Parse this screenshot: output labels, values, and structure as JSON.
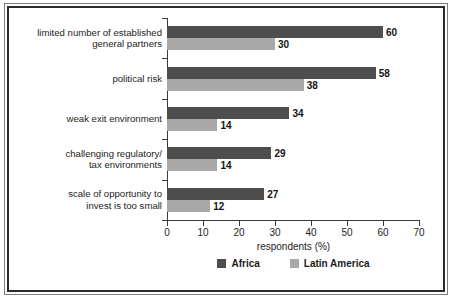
{
  "chart_data": {
    "type": "bar",
    "orientation": "horizontal",
    "title": "",
    "xlabel": "respondents (%)",
    "ylabel": "",
    "xlim": [
      0,
      70
    ],
    "xticks": [
      0,
      10,
      20,
      30,
      40,
      50,
      60,
      70
    ],
    "grid": false,
    "legend_position": "bottom",
    "categories": [
      "limited number of established\ngeneral partners",
      "political risk",
      "weak exit environment",
      "challenging regulatory/\ntax environments",
      "scale of opportunity to\ninvest is too small"
    ],
    "series": [
      {
        "name": "Africa",
        "color": "#4d4d4d",
        "values": [
          60,
          58,
          34,
          29,
          27
        ]
      },
      {
        "name": "Latin America",
        "color": "#a8a8a8",
        "values": [
          30,
          38,
          14,
          14,
          12
        ]
      }
    ]
  },
  "colors": {
    "africa": "#4d4d4d",
    "latin_america": "#a8a8a8",
    "axis": "#3a3a3a",
    "text": "#1c1c1c",
    "frame_outer": "#7d7d7d",
    "frame_inner": "#2b2b2b",
    "background": "#ffffff"
  }
}
